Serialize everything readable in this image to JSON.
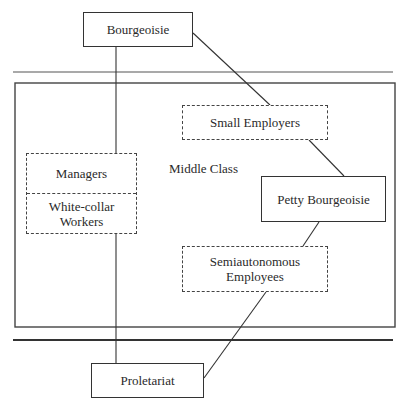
{
  "diagram": {
    "type": "class-structure",
    "nodes": {
      "bourgeoisie": {
        "label": "Bourgeoisie",
        "style": "solid"
      },
      "small_employers": {
        "label": "Small Employers",
        "style": "dashed"
      },
      "managers": {
        "label": "Managers",
        "style": "dashed"
      },
      "white_collar": {
        "label": "White-collar Workers",
        "style": "dashed"
      },
      "petty_bourgeoisie": {
        "label": "Petty Bourgeoisie",
        "style": "solid"
      },
      "semiautonomous": {
        "label": "Semiautonomous Employees",
        "style": "dashed"
      },
      "proletariat": {
        "label": "Proletariat",
        "style": "solid"
      }
    },
    "region_label": "Middle Class",
    "edges": [
      {
        "from": "bourgeoisie",
        "to": "small_employers"
      },
      {
        "from": "small_employers",
        "to": "petty_bourgeoisie"
      },
      {
        "from": "petty_bourgeoisie",
        "to": "semiautonomous"
      },
      {
        "from": "semiautonomous",
        "to": "proletariat"
      },
      {
        "from": "bourgeoisie",
        "to": "managers"
      },
      {
        "from": "white_collar",
        "to": "proletariat"
      }
    ]
  }
}
